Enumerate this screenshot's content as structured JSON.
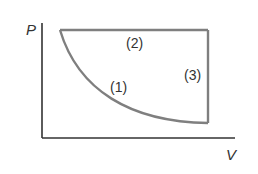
{
  "diagram": {
    "type": "pv-cycle",
    "axes": {
      "y_label": "P",
      "x_label": "V"
    },
    "processes": [
      {
        "id": "1",
        "label": "(1)",
        "shape": "curve",
        "description": "decreasing curve from top-left to bottom-right"
      },
      {
        "id": "2",
        "label": "(2)",
        "shape": "horizontal line",
        "description": "constant pressure along top"
      },
      {
        "id": "3",
        "label": "(3)",
        "shape": "vertical line",
        "description": "constant volume along right side"
      }
    ],
    "colors": {
      "axis": "#333333",
      "path": "#7f7f7f",
      "text": "#333333"
    }
  }
}
